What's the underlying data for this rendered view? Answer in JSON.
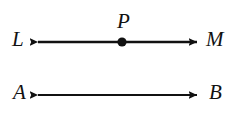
{
  "figure": {
    "kind": "geometry-diagram",
    "background_color": "#ffffff",
    "stroke_color": "#111111",
    "caption": "",
    "lines": [
      {
        "id": "line-LM",
        "type": "double-headed-arrow",
        "left_label": "L",
        "right_label": "M",
        "marked_point_label": "P",
        "y": 42,
        "x_start": 38,
        "x_end": 197,
        "point_x": 122
      },
      {
        "id": "line-AB",
        "type": "double-headed-arrow",
        "left_label": "A",
        "right_label": "B",
        "marked_point_label": "",
        "y": 95,
        "x_start": 38,
        "x_end": 197,
        "point_x": null
      }
    ],
    "labels": {
      "L": "L",
      "M": "M",
      "P": "P",
      "A": "A",
      "B": "B"
    }
  }
}
